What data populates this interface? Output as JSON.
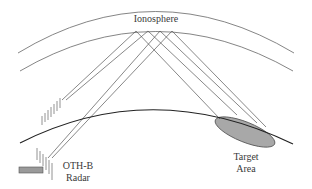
{
  "diagram": {
    "labels": {
      "ionosphere": "Ionosphere",
      "radar_line1": "OTH-B",
      "radar_line2": "Radar",
      "target_line1": "Target",
      "target_line2": "Area"
    },
    "colors": {
      "line": "#555555",
      "earth": "#222222",
      "target_fill": "#a8a8a8",
      "radar_fill": "#9a9a9a",
      "text": "#3a3a3a"
    },
    "elements": {
      "ionosphere_layer": "two concentric arcs",
      "earth_surface": "curved arc",
      "transmit_antenna": "array of short vertical ticks",
      "receive_antenna": "array of short vertical ticks",
      "radar_site": "gray rectangle",
      "target_area": "gray tilted ellipse",
      "ray_paths": 8
    }
  }
}
